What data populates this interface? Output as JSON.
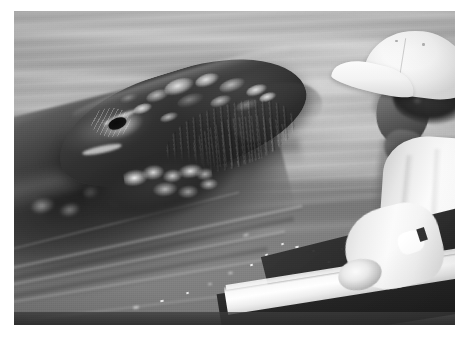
{
  "image": {
    "kind": "photograph",
    "medium": "black-and-white photograph with white print border",
    "title": "Gray whale surfacing beside a person in a small boat",
    "orientation": "landscape",
    "palette": {
      "paper_white": "#ffffff",
      "water_light": "#b9bcbd",
      "water_mid": "#93969a",
      "water_dark": "#74777b",
      "whale_dark": "#26292b",
      "whale_black": "#1b1e20",
      "barnacle_white": "#eef0f0",
      "shirt_white": "#ffffff",
      "cap_white": "#fafbfb",
      "hair_dark": "#2b2d2e",
      "boat_hull_dark": "#232526",
      "skin_shadow": "#56585 9"
    },
    "frame": {
      "border_px": {
        "left": 14,
        "top": 11,
        "right": 16,
        "bottom": 15
      },
      "print_size_px": {
        "width": 441,
        "height": 314
      }
    }
  },
  "scene": {
    "setting": "Open calm ocean water, bright overcast daylight",
    "water": {
      "description": "Calm sea surface with long horizontal streaks of reflected light, soft diagonal wake lines spreading from the whale toward the lower left",
      "tone": "light gray at top grading to darker gray toward the bottom"
    },
    "subjects": [
      {
        "id": "whale",
        "label": "Gray whale",
        "position": "left and center-left of frame",
        "description": "A large whale has raised its head and rostrum above the waterline, angled up toward the upper right. Its dark mottled skin is encrusted with pale barnacle and callosity patches. The submerged body stretches away into the lower-left corner.",
        "features": [
          "raised rostrum / snout breaking the surface",
          "visible eye with pale wrinkled skin folds around the socket",
          "clusters of bright white barnacles along the upper rostrum",
          "ridged grooves along the mouth line",
          "barnacle cluster on the chin / lower jaw",
          "pale scar blaze below the eye",
          "submerged dark flank trailing to the lower left"
        ]
      },
      {
        "id": "person",
        "label": "Person in boat",
        "position": "right edge of frame",
        "description": "A person seen from behind and slightly above, leaning over the side of a small boat toward the whale. They wear a white baseball cap and a white long-sleeved shirt; one arm reaches down toward the water and the boat's gunwale.",
        "features": [
          "white baseball cap with curved brim and crown seam",
          "dark curly hair below the cap",
          "face in shadow, turned away from the camera",
          "white shirt / sleeve",
          "arm extended down-left toward the water"
        ]
      },
      {
        "id": "boat",
        "label": "Small boat",
        "position": "lower right corner",
        "description": "The white painted gunwale of a small boat runs diagonally across the lower right corner, with the dark shaded interior of the hull below it."
      }
    ]
  },
  "caption": "Black-and-white photograph of a gray whale lifting its barnacle-covered head out of calm water beside a person in a white cap leaning over the side of a small boat."
}
